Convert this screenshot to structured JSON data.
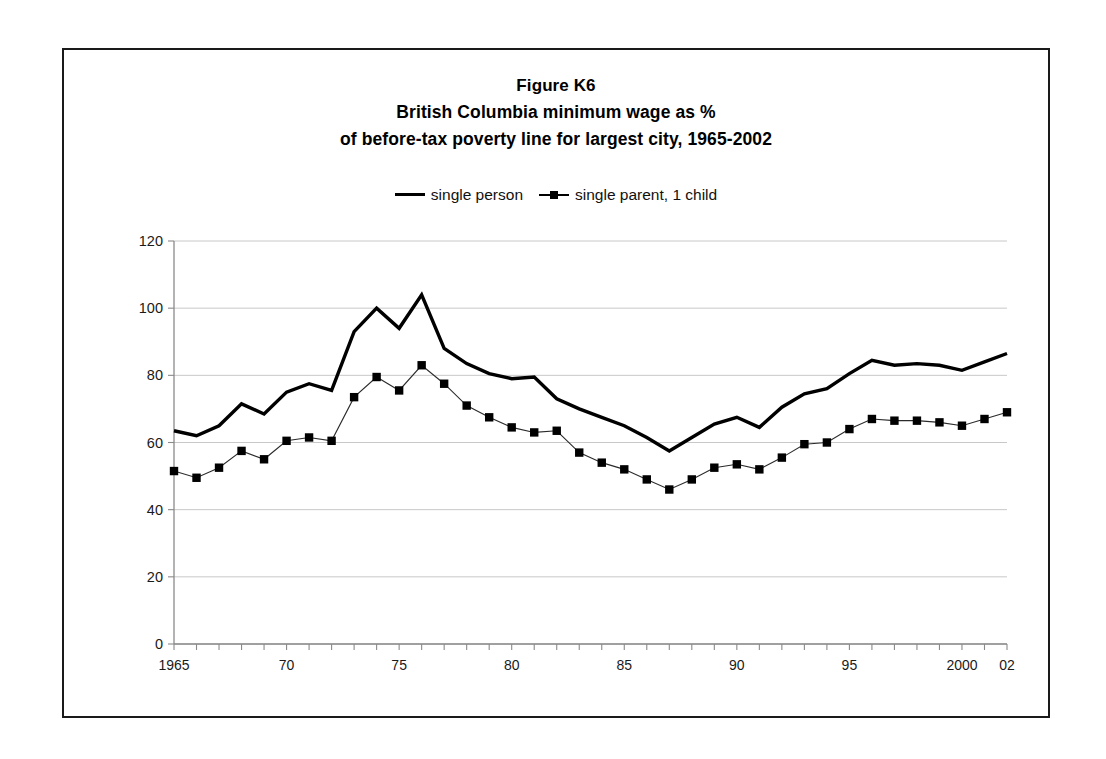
{
  "figure": {
    "title_line_1": "Figure K6",
    "title_line_2": "British Columbia minimum wage as %",
    "title_line_3": "of before-tax poverty line for largest city, 1965-2002"
  },
  "legend": {
    "position": "top-center",
    "entries": [
      {
        "label": "single person",
        "style": "solid-thick-line",
        "color": "#000000"
      },
      {
        "label": "single parent, 1 child",
        "style": "thin-line-square-marker",
        "color": "#000000"
      }
    ]
  },
  "axes": {
    "y_tick_labels": [
      "120",
      "100",
      "80",
      "60",
      "40",
      "20",
      "0"
    ],
    "x_tick_labels": [
      {
        "year": 1965,
        "label": "1965"
      },
      {
        "year": 1970,
        "label": "70"
      },
      {
        "year": 1975,
        "label": "75"
      },
      {
        "year": 1980,
        "label": "80"
      },
      {
        "year": 1985,
        "label": "85"
      },
      {
        "year": 1990,
        "label": "90"
      },
      {
        "year": 1995,
        "label": "95"
      },
      {
        "year": 2000,
        "label": "2000"
      },
      {
        "year": 2002,
        "label": "02"
      }
    ]
  },
  "chart_data": {
    "type": "line",
    "xlabel": "",
    "ylabel": "",
    "ylim": [
      0,
      120
    ],
    "xlim": [
      1965,
      2002
    ],
    "ytick_step": 20,
    "grid": true,
    "legend_position": "top-center",
    "x": [
      1965,
      1966,
      1967,
      1968,
      1969,
      1970,
      1971,
      1972,
      1973,
      1974,
      1975,
      1976,
      1977,
      1978,
      1979,
      1980,
      1981,
      1982,
      1983,
      1984,
      1985,
      1986,
      1987,
      1988,
      1989,
      1990,
      1991,
      1992,
      1993,
      1994,
      1995,
      1996,
      1997,
      1998,
      1999,
      2000,
      2001,
      2002
    ],
    "series": [
      {
        "name": "single person",
        "values": [
          63.5,
          62.0,
          65.0,
          71.5,
          68.5,
          75.0,
          77.5,
          75.5,
          93.0,
          100.0,
          94.0,
          104.0,
          88.0,
          83.5,
          80.5,
          79.0,
          79.5,
          73.0,
          70.0,
          67.5,
          65.0,
          61.5,
          57.5,
          61.5,
          65.5,
          67.5,
          64.5,
          70.5,
          74.5,
          76.0,
          80.5,
          84.5,
          83.0,
          83.5,
          83.0,
          81.5,
          84.0,
          86.5
        ]
      },
      {
        "name": "single parent, 1 child",
        "values": [
          51.5,
          49.5,
          52.5,
          57.5,
          55.0,
          60.5,
          61.5,
          60.5,
          73.5,
          79.5,
          75.5,
          83.0,
          77.5,
          71.0,
          67.5,
          64.5,
          63.0,
          63.5,
          57.0,
          54.0,
          52.0,
          49.0,
          46.0,
          49.0,
          52.5,
          53.5,
          52.0,
          55.5,
          59.5,
          60.0,
          64.0,
          67.0,
          66.5,
          66.5,
          66.0,
          65.0,
          67.0,
          69.0
        ]
      }
    ]
  }
}
